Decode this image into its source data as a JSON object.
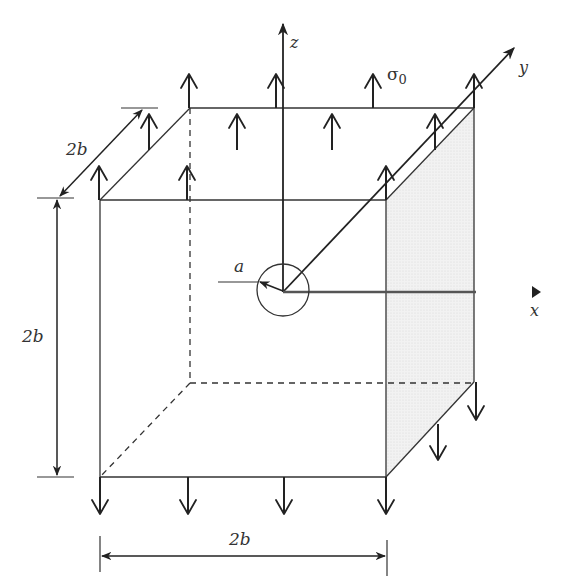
{
  "figure": {
    "labels": {
      "z_axis": "z",
      "y_axis": "y",
      "x_axis": "x",
      "stress": "σ",
      "stress_sub": "0",
      "radius": "a",
      "dim_depth": "2b",
      "dim_height": "2b",
      "dim_width": "2b"
    },
    "colors": {
      "line": "#333333",
      "shaded_face": "#eeeeee",
      "background": "#ffffff"
    }
  }
}
